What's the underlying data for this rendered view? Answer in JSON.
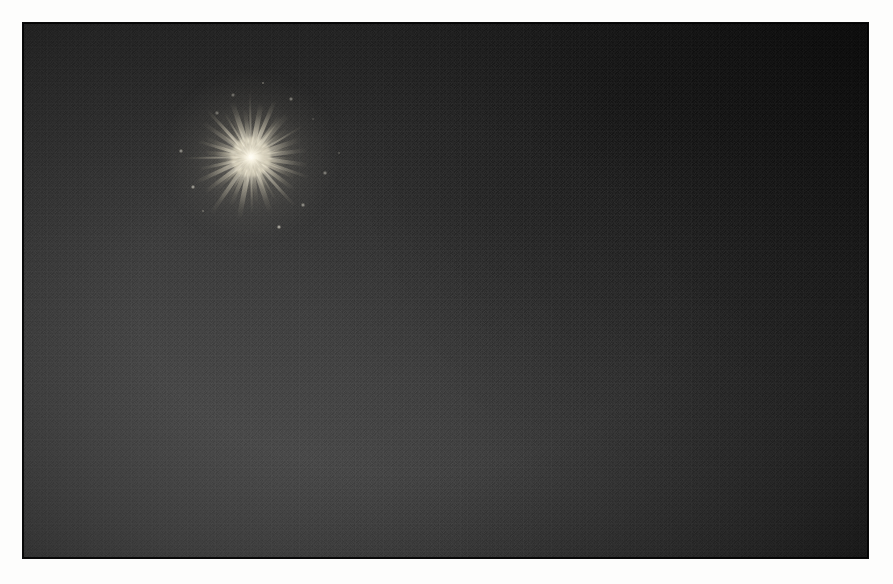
{
  "image": {
    "subject": "firework burst",
    "scene": "night sky",
    "orientation": "landscape",
    "frame_border_color": "#fdfdfc",
    "sky_color_dark": "#101010",
    "sky_color_light": "#2e2e2e",
    "burst_core_color": "#fffdf4",
    "burst_streak_color": "#f6f1e0",
    "plate": {
      "x": 23,
      "y": 23,
      "width": 845,
      "height": 535
    },
    "burst": {
      "center_x": 251,
      "center_y": 157,
      "width": 145,
      "height": 128
    }
  },
  "chart_data": {
    "type": "scatter",
    "xlabel": "angle (degrees)",
    "ylabel": "streak length (px)",
    "center": [
      251,
      157
    ],
    "xlim": [
      0,
      360
    ],
    "ylim": [
      0,
      80
    ],
    "grid": false,
    "legend": "none",
    "series": [
      {
        "name": "streaks",
        "angles": [
          2,
          8,
          14,
          19,
          25,
          31,
          37,
          42,
          48,
          54,
          60,
          66,
          71,
          77,
          83,
          89,
          95,
          101,
          107,
          113,
          119,
          125,
          131,
          137,
          143,
          149,
          155,
          161,
          167,
          173,
          179,
          185,
          191,
          197,
          203,
          209,
          215,
          221,
          227,
          233,
          239,
          245,
          251,
          257,
          263,
          269,
          275,
          281,
          287,
          293,
          299,
          305,
          311,
          317,
          323,
          329,
          335,
          341,
          347,
          353
        ],
        "lengths": [
          44,
          58,
          36,
          62,
          48,
          30,
          54,
          40,
          66,
          34,
          50,
          42,
          60,
          28,
          46,
          56,
          38,
          64,
          32,
          52,
          44,
          70,
          36,
          48,
          58,
          30,
          62,
          40,
          54,
          34,
          68,
          46,
          38,
          56,
          50,
          28,
          60,
          42,
          64,
          32,
          52,
          44,
          58,
          36,
          48,
          66,
          30,
          54,
          40,
          62,
          34,
          50,
          56,
          38,
          46,
          60,
          28,
          52,
          42,
          57
        ]
      }
    ],
    "annotations": [
      {
        "label": "bright core",
        "x": 251,
        "y": 157,
        "radius": 20
      }
    ]
  },
  "sparks": {
    "positions": [
      [
        62,
        -38
      ],
      [
        74,
        16
      ],
      [
        -70,
        -6
      ],
      [
        -48,
        54
      ],
      [
        28,
        70
      ],
      [
        -18,
        -62
      ],
      [
        88,
        -4
      ],
      [
        52,
        48
      ],
      [
        -58,
        30
      ],
      [
        12,
        -74
      ],
      [
        -34,
        -44
      ],
      [
        40,
        -58
      ]
    ]
  }
}
